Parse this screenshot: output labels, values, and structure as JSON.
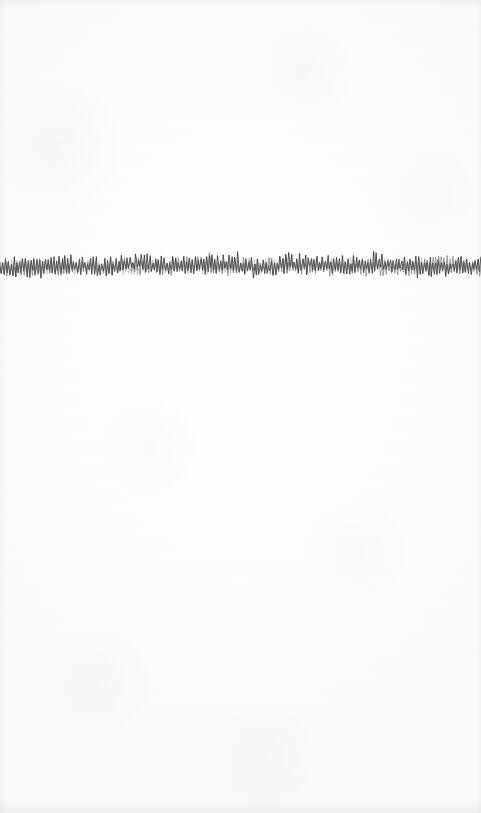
{
  "page": {
    "width": 481,
    "height": 813,
    "background_color": "#fdfdfd",
    "paper_tone": "#fafafa",
    "content_description": "A single horizontal band of dense hand-drawn zigzag pen scribble running the full width of an otherwise blank off-white page."
  },
  "artwork": {
    "name": "horizontal-scribble-line",
    "type": "freehand-zigzag-stroke",
    "ink_color": "#4a4a4a",
    "ink_color_dark": "#333333",
    "ink_color_light": "#6e6e6e",
    "stroke_width": 0.9,
    "band": {
      "x_start": 0,
      "x_end": 481,
      "y_center": 270,
      "y_top": 256,
      "y_bottom": 285,
      "height": 29
    },
    "geometry": {
      "seed": 20250714,
      "spike_count": 340,
      "baseline_amplitude": 3.2,
      "spike_amplitude_min": 4,
      "spike_amplitude_max": 13,
      "descender_amplitude_max": 7,
      "pass_count": 3,
      "pass_opacities": [
        0.92,
        0.6,
        0.38
      ]
    }
  },
  "regions": {
    "top_blank": {
      "label": "blank upper margin",
      "y_start": 0,
      "y_end": 255
    },
    "bottom_blank": {
      "label": "blank lower area",
      "y_start": 286,
      "y_end": 813
    }
  }
}
